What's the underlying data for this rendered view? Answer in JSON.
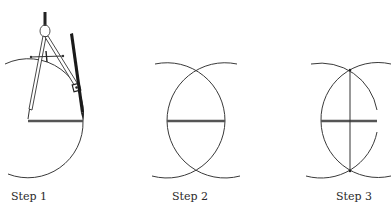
{
  "figure": {
    "steps": [
      {
        "label": "Step 1",
        "description": "Compass centered on left endpoint draws arc through right endpoint"
      },
      {
        "label": "Step 2",
        "description": "Arcs from both endpoints intersect above and below the segment"
      },
      {
        "label": "Step 3",
        "description": "Line through intersection points bisects the segment"
      }
    ]
  },
  "colors": {
    "stroke": "#3a3a3a",
    "segment": "#555555",
    "background": "#ffffff"
  }
}
